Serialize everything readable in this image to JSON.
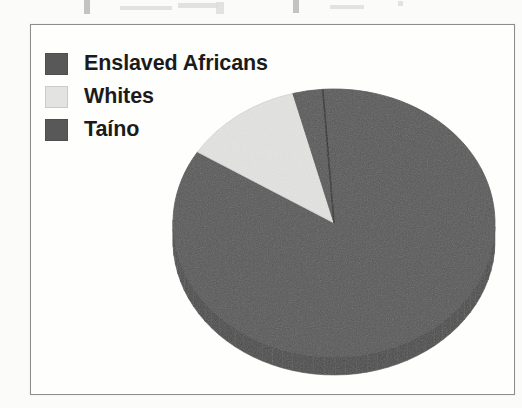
{
  "figure": {
    "frame_border_color": "#8d8d8d",
    "background_color": "#fefefd"
  },
  "legend": {
    "position": "top-left",
    "items": [
      {
        "label": "Enslaved Africans",
        "color": "#585858",
        "swatch_name": "legend-swatch-enslaved-africans"
      },
      {
        "label": "Whites",
        "color": "#e3e3e1",
        "swatch_name": "legend-swatch-whites"
      },
      {
        "label": "Taíno",
        "color": "#585858",
        "swatch_name": "legend-swatch-taino"
      }
    ]
  },
  "chart_data": {
    "type": "pie",
    "title": "",
    "subtitle": "",
    "xlabel": "",
    "ylabel": "",
    "grid": false,
    "legend_position": "top-left",
    "three_d": true,
    "start_angle_deg": -4,
    "direction": "clockwise",
    "categories": [
      "Enslaved Africans",
      "Whites",
      "Taíno"
    ],
    "values": [
      85,
      12,
      3
    ],
    "units": "percent",
    "colors": [
      "#585858",
      "#e3e3e1",
      "#585858"
    ],
    "slices": [
      {
        "label": "Enslaved Africans",
        "value": 85,
        "color": "#585858",
        "side_color": "#4a4a4a"
      },
      {
        "label": "Whites",
        "value": 12,
        "color": "#e3e3e1",
        "side_color": "#c2c2c0"
      },
      {
        "label": "Taíno",
        "value": 3,
        "color": "#585858",
        "side_color": "#4a4a4a"
      }
    ],
    "geometry": {
      "center_x": 303,
      "center_y": 198,
      "radius_x": 161,
      "radius_y": 134,
      "depth": 18
    }
  }
}
